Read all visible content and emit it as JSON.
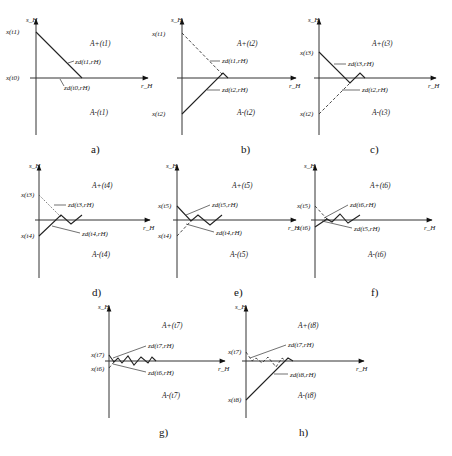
{
  "figure": {
    "panels": [
      {
        "id": "a",
        "caption": "a)",
        "y_axis_label": "s_H",
        "x_axis_label": "r_H",
        "region_upper": "A+(t1)",
        "region_lower": "A-(t1)",
        "y_ticks": [
          "x(t1)",
          "x(t0)"
        ],
        "curve_labels": [
          "zd(t1,rH)",
          "zd(t0,rH)"
        ]
      },
      {
        "id": "b",
        "caption": "b)",
        "y_axis_label": "s_H",
        "x_axis_label": "r_H",
        "region_upper": "A+(t2)",
        "region_lower": "A-(t2)",
        "y_ticks": [
          "x(t1)",
          "x(t2)"
        ],
        "curve_labels": [
          "zd(t1,rH)",
          "zd(t2,rH)"
        ]
      },
      {
        "id": "c",
        "caption": "c)",
        "y_axis_label": "s_H",
        "x_axis_label": "r_H",
        "region_upper": "A+(t3)",
        "region_lower": "A-(t3)",
        "y_ticks": [
          "x(t3)",
          "x(t2)"
        ],
        "curve_labels": [
          "zd(t3,rH)",
          "zd(t2,rH)"
        ]
      },
      {
        "id": "d",
        "caption": "d)",
        "y_axis_label": "s_H",
        "x_axis_label": "r_H",
        "region_upper": "A+(t4)",
        "region_lower": "A-(t4)",
        "y_ticks": [
          "x(t3)",
          "x(t4)"
        ],
        "curve_labels": [
          "zd(t3,rH)",
          "zd(t4,rH)"
        ]
      },
      {
        "id": "e",
        "caption": "e)",
        "y_axis_label": "s_H",
        "x_axis_label": "r_H",
        "region_upper": "A+(t5)",
        "region_lower": "A-(t5)",
        "y_ticks": [
          "x(t5)",
          "x(t4)"
        ],
        "curve_labels": [
          "zd(t5,rH)",
          "zd(t4,rH)"
        ]
      },
      {
        "id": "f",
        "caption": "f)",
        "y_axis_label": "s_H",
        "x_axis_label": "r_H",
        "region_upper": "A+(t6)",
        "region_lower": "A-(t6)",
        "y_ticks": [
          "x(t5)",
          "x(t6)"
        ],
        "curve_labels": [
          "zd(t6,rH)",
          "zd(t5,rH)"
        ]
      },
      {
        "id": "g",
        "caption": "g)",
        "y_axis_label": "s_H",
        "x_axis_label": "r_H",
        "region_upper": "A+(t7)",
        "region_lower": "A-(t7)",
        "y_ticks": [
          "x(t7)",
          "x(t6)"
        ],
        "curve_labels": [
          "zd(t7,rH)",
          "zd(t6,rH)"
        ]
      },
      {
        "id": "h",
        "caption": "h)",
        "y_axis_label": "s_H",
        "x_axis_label": "r_H",
        "region_upper": "A+(t8)",
        "region_lower": "A-(t8)",
        "y_ticks": [
          "x(t7)",
          "x(t8)"
        ],
        "curve_labels": [
          "zd(t7,rH)",
          "zd(t8,rH)"
        ]
      }
    ]
  }
}
